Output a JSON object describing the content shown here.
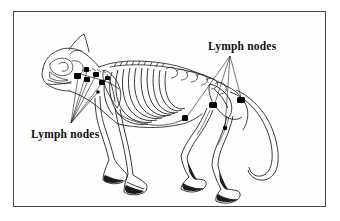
{
  "figure": {
    "view": "lateral left side",
    "background_color": "#ffffff",
    "frame_color": "#4a4a4f",
    "ink_color": "#101010",
    "node_marker_color": "#000000",
    "frame": {
      "x": 13,
      "y": 11,
      "width": 313,
      "height": 196
    }
  },
  "labels": [
    {
      "id": "label-top-right",
      "text": "Lymph nodes",
      "position": {
        "x": 194,
        "y": 29
      },
      "anchor": {
        "x": 216,
        "y": 44
      },
      "points_to": [
        "popliteal",
        "superficial-inguinal",
        "sacral",
        "iliac"
      ]
    },
    {
      "id": "label-bottom-left",
      "text": "Lymph nodes",
      "position": {
        "x": 17,
        "y": 117
      },
      "anchor": {
        "x": 57,
        "y": 111
      },
      "points_to": [
        "mandibular",
        "parotid",
        "retropharyngeal",
        "superficial-cervical",
        "axillary"
      ]
    }
  ],
  "lymph_nodes": [
    {
      "id": "parotid",
      "x": 72,
      "y": 57,
      "w": 5,
      "h": 5
    },
    {
      "id": "mandibular-a",
      "x": 62,
      "y": 62,
      "w": 6,
      "h": 6
    },
    {
      "id": "mandibular-b",
      "x": 71,
      "y": 66,
      "w": 5,
      "h": 5
    },
    {
      "id": "retropharyngeal",
      "x": 80,
      "y": 61,
      "w": 5,
      "h": 4
    },
    {
      "id": "superficial-cervical-a",
      "x": 86,
      "y": 69,
      "w": 5,
      "h": 5
    },
    {
      "id": "superficial-cervical-b",
      "x": 92,
      "y": 66,
      "w": 4,
      "h": 4
    },
    {
      "id": "axillary",
      "x": 83,
      "y": 79,
      "w": 3,
      "h": 3
    },
    {
      "id": "iliac",
      "x": 197,
      "y": 92,
      "w": 7,
      "h": 5
    },
    {
      "id": "superficial-inguinal",
      "x": 225,
      "y": 87,
      "w": 7,
      "h": 5
    },
    {
      "id": "sacral",
      "x": 170,
      "y": 105,
      "w": 5,
      "h": 5
    },
    {
      "id": "popliteal",
      "x": 210,
      "y": 115,
      "w": 4,
      "h": 4
    }
  ],
  "leader_lines": {
    "bottom_left_origin": {
      "x": 57,
      "y": 111
    },
    "top_right_origin": {
      "x": 216,
      "y": 44
    }
  }
}
